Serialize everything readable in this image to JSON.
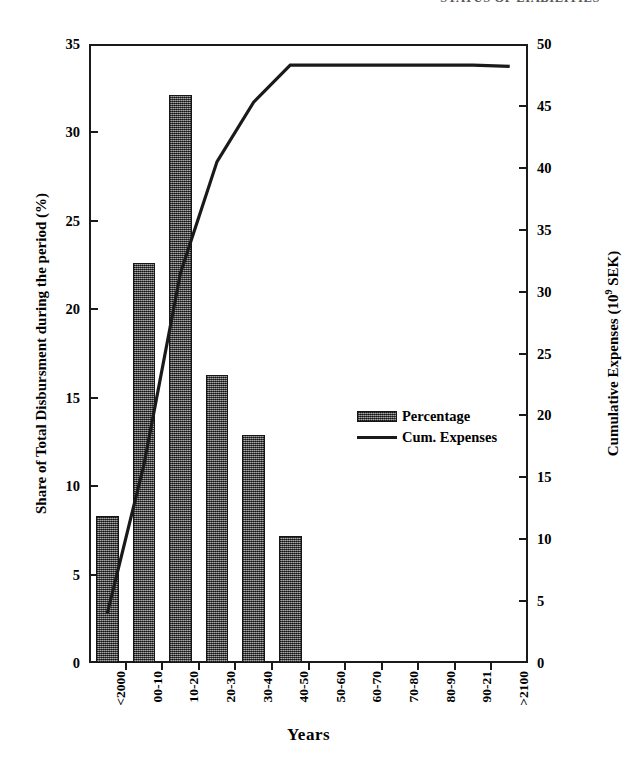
{
  "header": {
    "running_head": "STATUS OF LIABILITIES"
  },
  "chart_data": {
    "type": "bar",
    "title": "",
    "categories": [
      "<2000",
      "00-10",
      "10-20",
      "20-30",
      "30-40",
      "40-50",
      "50-60",
      "60-70",
      "70-80",
      "80-90",
      "90-21",
      ">2100"
    ],
    "xlabel": "Years",
    "ylabel": "Share of Total Disbursment during the period (%)",
    "ylabel_right": "Cumulative Expenses (10⁹ SEK)",
    "ylim": [
      0,
      35
    ],
    "ylim_right": [
      0,
      50
    ],
    "yticks": [
      0,
      5,
      10,
      15,
      20,
      25,
      30,
      35
    ],
    "yticks_right": [
      0,
      5,
      10,
      15,
      20,
      25,
      30,
      35,
      40,
      45,
      50
    ],
    "grid": false,
    "legend_position": "center-right",
    "series": [
      {
        "name": "Percentage",
        "type": "bar",
        "axis": "left",
        "values": [
          8.3,
          22.6,
          32.1,
          16.3,
          12.9,
          7.2,
          0,
          0,
          0,
          0,
          0,
          0
        ]
      },
      {
        "name": "Cum. Expenses",
        "type": "line",
        "axis": "right",
        "values": [
          4.0,
          16.0,
          31.5,
          40.5,
          45.3,
          48.3,
          48.3,
          48.3,
          48.3,
          48.3,
          48.3,
          48.2
        ]
      }
    ]
  },
  "legend": {
    "items": [
      {
        "label": "Percentage",
        "marker": "hatched-bar-swatch"
      },
      {
        "label": "Cum. Expenses",
        "marker": "solid-line-swatch"
      }
    ]
  },
  "colors": {
    "bar_fill": "#575757",
    "bar_edge": "#161616",
    "line": "#1a1a1a",
    "axis": "#1a1a1a",
    "background": "#ffffff"
  }
}
